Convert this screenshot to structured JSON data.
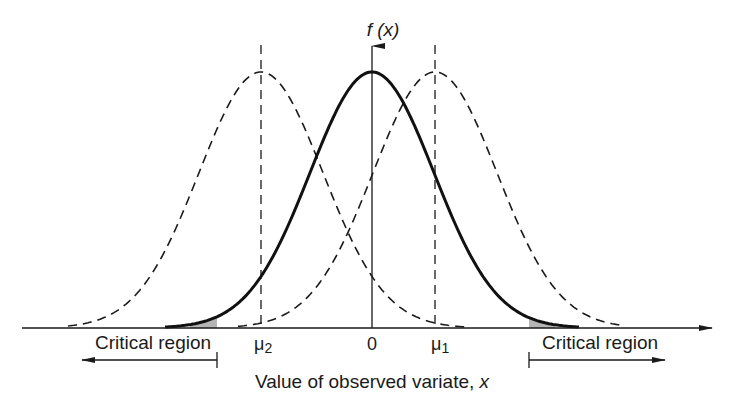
{
  "figure": {
    "y_axis_label": "f (x)",
    "x_axis_label": "Value of observed variate, x",
    "tick_labels": {
      "mu2": "μ",
      "mu2_sub": "2",
      "zero": "0",
      "mu1": "μ",
      "mu1_sub": "1"
    },
    "critical_region_left": "Critical region",
    "critical_region_right": "Critical region"
  },
  "diagram": {
    "type": "normal-distributions-hypothesis-test",
    "curves": [
      {
        "name": "null-distribution",
        "mean_label": "0",
        "style": "solid"
      },
      {
        "name": "alternative-distribution-1",
        "mean_label": "μ1",
        "style": "dashed"
      },
      {
        "name": "alternative-distribution-2",
        "mean_label": "μ2",
        "style": "dashed"
      }
    ],
    "shaded_regions": [
      "left-tail",
      "right-tail"
    ],
    "colors": {
      "line": "#1a1a1a",
      "shade": "#b5b5b5"
    }
  }
}
